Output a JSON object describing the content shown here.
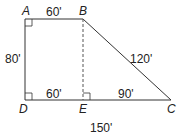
{
  "diagram": {
    "type": "trapezoid",
    "points": {
      "A": {
        "label": "A",
        "x": 25,
        "y": 19
      },
      "B": {
        "label": "B",
        "x": 83,
        "y": 19
      },
      "C": {
        "label": "C",
        "x": 171,
        "y": 100
      },
      "D": {
        "label": "D",
        "x": 25,
        "y": 100
      },
      "E": {
        "label": "E",
        "x": 83,
        "y": 100
      }
    },
    "measures": {
      "AB": "60'",
      "AD": "80'",
      "BC": "120'",
      "DE": "60'",
      "EC": "90'",
      "DC": "150'"
    },
    "right_angles": [
      "A",
      "D",
      "E"
    ],
    "dashed_segment": "BE",
    "colors": {
      "stroke": "#333333",
      "text": "#222222"
    }
  }
}
